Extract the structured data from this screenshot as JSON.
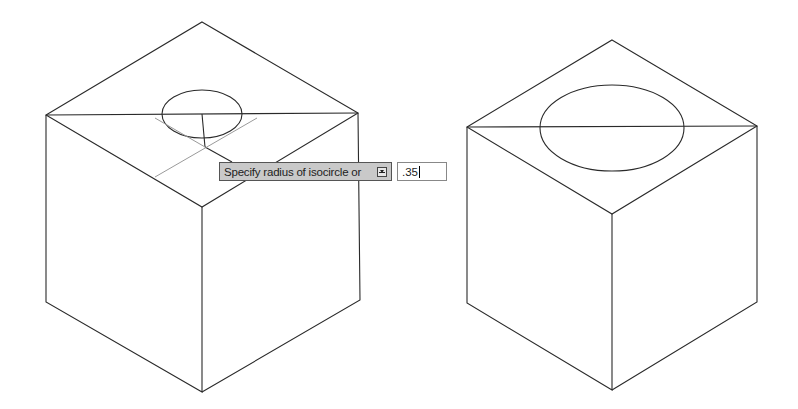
{
  "prompt": {
    "label": "Specify radius of isocircle or",
    "options_icon": "down-arrow-options-icon",
    "input_value": ".35"
  },
  "drawing": {
    "line_color": "#2a2a2a",
    "tracking_color": "#9a9a9a",
    "tooltip_bg": "#c9c9c9"
  }
}
